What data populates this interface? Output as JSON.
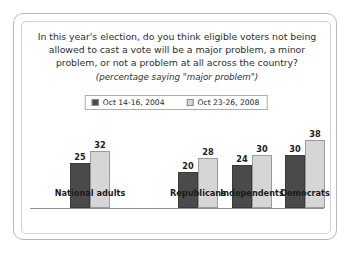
{
  "card": {
    "title_lines": [
      "In this year's election, do you think eligible voters not being",
      "allowed to cast a vote will be a major problem, a minor",
      "problem, or not a problem at all across the country?"
    ],
    "subtitle": "(percentage saying \"major problem\")"
  },
  "legend": {
    "items": [
      {
        "label": "Oct 14-16, 2004",
        "color": "#4a4a4a"
      },
      {
        "label": "Oct 23-26, 2008",
        "color": "#d6d6d6"
      }
    ]
  },
  "chart_data": {
    "type": "bar",
    "title": "In this year's election, do you think eligible voters not being allowed to cast a vote will be a major problem, a minor problem, or not a problem at all across the country?",
    "subtitle": "(percentage saying \"major problem\")",
    "xlabel": "",
    "ylabel": "",
    "ylim": [
      0,
      45
    ],
    "grid": false,
    "legend_position": "top-center",
    "categories": [
      "National adults",
      "Republicans",
      "Independents",
      "Democrats"
    ],
    "series": [
      {
        "name": "Oct 14-16, 2004",
        "color": "#4a4a4a",
        "values": [
          25,
          20,
          24,
          30
        ]
      },
      {
        "name": "Oct 23-26, 2008",
        "color": "#d6d6d6",
        "values": [
          32,
          28,
          30,
          38
        ]
      }
    ]
  }
}
